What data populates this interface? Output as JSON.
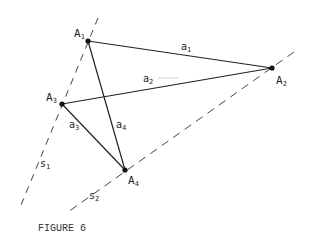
{
  "figure": {
    "caption": "FIGURE 6",
    "points": [
      {
        "id": "A1",
        "label": "A",
        "sub": "1",
        "x": 88,
        "y": 41,
        "lx": 74,
        "ly": 37
      },
      {
        "id": "A2",
        "label": "A",
        "sub": "2",
        "x": 272,
        "y": 68,
        "lx": 276,
        "ly": 84
      },
      {
        "id": "A3",
        "label": "A",
        "sub": "3",
        "x": 62,
        "y": 104,
        "lx": 46,
        "ly": 101
      },
      {
        "id": "A4",
        "label": "A",
        "sub": "4",
        "x": 125,
        "y": 170,
        "lx": 128,
        "ly": 184
      }
    ],
    "segments": [
      {
        "id": "a1",
        "from": "A1",
        "to": "A2",
        "label": "a",
        "sub": "1",
        "lx": 181,
        "ly": 50
      },
      {
        "id": "a2",
        "from": "A3",
        "to": "A2",
        "label": "a",
        "sub": "2",
        "lx": 143,
        "ly": 82
      },
      {
        "id": "a3",
        "from": "A3",
        "to": "A4",
        "label": "a",
        "sub": "3",
        "lx": 69,
        "ly": 128
      },
      {
        "id": "a4",
        "from": "A1",
        "to": "A4",
        "label": "a",
        "sub": "4",
        "lx": 116,
        "ly": 128
      }
    ],
    "dashed_lines": [
      {
        "id": "s1",
        "x1": 98,
        "y1": 18,
        "x2": 19,
        "y2": 210,
        "label": "s",
        "sub": "1",
        "lx": 40,
        "ly": 167
      },
      {
        "id": "s2",
        "x1": 294,
        "y1": 52,
        "x2": 68,
        "y2": 212,
        "label": "s",
        "sub": "2",
        "lx": 89,
        "ly": 199
      }
    ]
  }
}
